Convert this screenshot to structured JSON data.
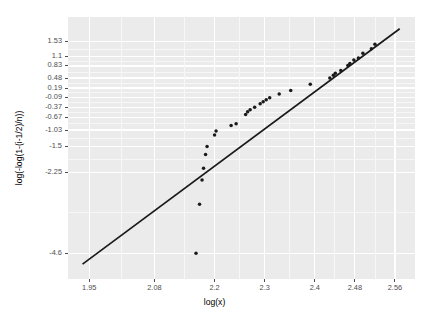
{
  "chart_data": {
    "type": "scatter",
    "title": "",
    "subtitle": "",
    "xlabel": "log(x)",
    "ylabel": "log(-log(1-(i-1/2)/n))",
    "xlim": [
      1.9075,
      2.6
    ],
    "ylim": [
      -5.35,
      2.25
    ],
    "grid": true,
    "legend_position": "none",
    "xticks": [
      1.95,
      2.08,
      2.2,
      2.3,
      2.4,
      2.48,
      2.56
    ],
    "xtick_labels": [
      "1.95",
      "2.08",
      "2.2",
      "2.3",
      "2.4",
      "2.48",
      "2.56"
    ],
    "yticks": [
      1.53,
      1.1,
      0.83,
      0.48,
      0.19,
      -0.09,
      -0.37,
      -0.67,
      -1.03,
      -1.5,
      -2.25,
      -4.6
    ],
    "ytick_labels": [
      "1.53",
      "1.1",
      "0.83",
      "0.48",
      "0.19",
      "-0.09",
      "-0.37",
      "-0.67",
      "-1.03",
      "-1.5",
      "-2.25",
      "-4.6"
    ],
    "series": [
      {
        "name": "order statistics",
        "marker": "point",
        "color": "#1a1a1a",
        "points": [
          [
            2.163,
            -4.6
          ],
          [
            2.17,
            -3.18
          ],
          [
            2.175,
            -2.48
          ],
          [
            2.178,
            -2.14
          ],
          [
            2.182,
            -1.74
          ],
          [
            2.185,
            -1.51
          ],
          [
            2.2,
            -1.17
          ],
          [
            2.203,
            -1.06
          ],
          [
            2.233,
            -0.9
          ],
          [
            2.243,
            -0.85
          ],
          [
            2.262,
            -0.58
          ],
          [
            2.266,
            -0.5
          ],
          [
            2.271,
            -0.44
          ],
          [
            2.28,
            -0.37
          ],
          [
            2.291,
            -0.27
          ],
          [
            2.297,
            -0.21
          ],
          [
            2.303,
            -0.15
          ],
          [
            2.31,
            -0.09
          ],
          [
            2.329,
            0.02
          ],
          [
            2.352,
            0.12
          ],
          [
            2.391,
            0.3
          ],
          [
            2.43,
            0.48
          ],
          [
            2.437,
            0.56
          ],
          [
            2.441,
            0.62
          ],
          [
            2.452,
            0.7
          ],
          [
            2.466,
            0.84
          ],
          [
            2.47,
            0.9
          ],
          [
            2.478,
            1.0
          ],
          [
            2.487,
            1.06
          ],
          [
            2.496,
            1.2
          ],
          [
            2.513,
            1.33
          ],
          [
            2.52,
            1.46
          ]
        ]
      }
    ],
    "reference_line": {
      "name": "fitted Weibull line",
      "color": "#1a1a1a",
      "x0": 1.9365,
      "y0": -4.92,
      "x1": 2.5695,
      "y1": 1.91
    }
  }
}
